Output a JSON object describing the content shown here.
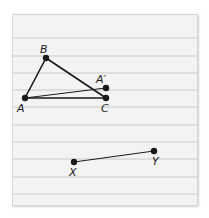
{
  "paper": {
    "background": "#f3f3f3",
    "rule_color": "#c9c9c9",
    "rules_y": [
      38,
      56,
      73,
      90,
      107,
      125,
      142,
      159,
      177,
      194
    ]
  },
  "diagram": {
    "stroke_color": "#1a1a1a",
    "points": {
      "A": {
        "label": "A",
        "x": 25,
        "y": 98
      },
      "B": {
        "label": "B",
        "x": 46,
        "y": 58
      },
      "C": {
        "label": "C",
        "x": 106,
        "y": 98
      },
      "A_prime": {
        "label": "A′",
        "x": 106,
        "y": 88
      },
      "X": {
        "label": "X",
        "x": 74,
        "y": 162
      },
      "Y": {
        "label": "Y",
        "x": 154,
        "y": 151
      }
    },
    "segments": [
      {
        "from": "A",
        "to": "B",
        "width": 1.6
      },
      {
        "from": "B",
        "to": "C",
        "width": 1.6
      },
      {
        "from": "A",
        "to": "C",
        "width": 1.6
      },
      {
        "from": "A",
        "to": "A_prime",
        "width": 1.0
      },
      {
        "from": "X",
        "to": "Y",
        "width": 1.0
      }
    ]
  }
}
